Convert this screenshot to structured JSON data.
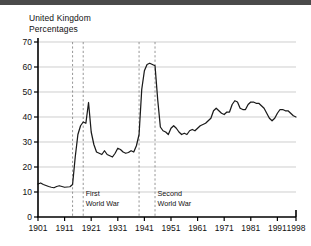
{
  "title": "United Kingdom",
  "subtitle": "Percentages",
  "chart_data": {
    "type": "line",
    "title": "United Kingdom",
    "subtitle": "Percentages",
    "xlabel": "",
    "ylabel": "Percentages",
    "xlim": [
      1901,
      1998
    ],
    "ylim": [
      0,
      70
    ],
    "yticks": [
      0,
      10,
      20,
      30,
      40,
      50,
      60,
      70
    ],
    "xticks": [
      1901,
      1911,
      1921,
      1931,
      1941,
      1951,
      1961,
      1971,
      1981,
      1991,
      1998
    ],
    "grid": true,
    "legend": "none",
    "annotations": [
      {
        "label": "First\nWorld War",
        "line1": "First",
        "line2": "World War",
        "span_start": 1914,
        "span_end": 1918
      },
      {
        "label": "Second\nWorld War",
        "line1": "Second",
        "line2": "World War",
        "span_start": 1939,
        "span_end": 1945
      }
    ],
    "series": [
      {
        "name": "Public expenditure as percentage of GDP",
        "x": [
          1901,
          1902,
          1903,
          1904,
          1905,
          1906,
          1907,
          1908,
          1909,
          1910,
          1911,
          1912,
          1913,
          1914,
          1915,
          1916,
          1917,
          1918,
          1919,
          1920,
          1921,
          1922,
          1923,
          1924,
          1925,
          1926,
          1927,
          1928,
          1929,
          1930,
          1931,
          1932,
          1933,
          1934,
          1935,
          1936,
          1937,
          1938,
          1939,
          1940,
          1941,
          1942,
          1943,
          1944,
          1945,
          1946,
          1947,
          1948,
          1949,
          1950,
          1951,
          1952,
          1953,
          1954,
          1955,
          1956,
          1957,
          1958,
          1959,
          1960,
          1961,
          1962,
          1963,
          1964,
          1965,
          1966,
          1967,
          1968,
          1969,
          1970,
          1971,
          1972,
          1973,
          1974,
          1975,
          1976,
          1977,
          1978,
          1979,
          1980,
          1981,
          1982,
          1983,
          1984,
          1985,
          1986,
          1987,
          1988,
          1989,
          1990,
          1991,
          1992,
          1993,
          1994,
          1995,
          1996,
          1997,
          1998
        ],
        "y": [
          13.2,
          13.6,
          13.0,
          12.6,
          12.2,
          11.9,
          11.7,
          12.2,
          12.5,
          12.2,
          11.9,
          12.0,
          12.1,
          13.0,
          24.0,
          33.0,
          36.5,
          38.0,
          37.5,
          45.8,
          34.0,
          29.0,
          26.0,
          25.5,
          25.0,
          26.5,
          25.0,
          24.5,
          24.0,
          25.5,
          27.5,
          27.0,
          26.0,
          25.5,
          25.8,
          26.5,
          26.0,
          28.5,
          33.0,
          51.0,
          58.5,
          61.0,
          61.5,
          61.0,
          60.5,
          47.0,
          36.0,
          34.5,
          34.0,
          33.0,
          35.5,
          36.5,
          35.5,
          34.0,
          33.0,
          33.5,
          33.0,
          34.5,
          35.0,
          34.5,
          35.5,
          36.5,
          37.0,
          37.5,
          38.5,
          39.5,
          42.5,
          43.5,
          42.5,
          41.5,
          41.0,
          42.0,
          42.0,
          45.0,
          46.5,
          46.0,
          43.5,
          43.0,
          43.0,
          45.0,
          46.0,
          46.0,
          45.5,
          45.5,
          44.5,
          43.5,
          41.5,
          39.5,
          38.5,
          39.5,
          41.5,
          43.0,
          43.0,
          42.5,
          42.5,
          41.5,
          40.5,
          40.0
        ]
      }
    ]
  }
}
